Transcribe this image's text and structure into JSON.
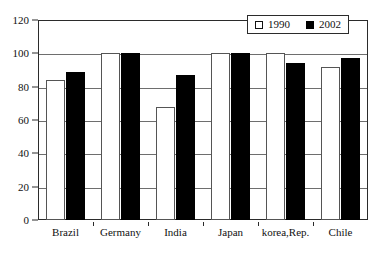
{
  "chart_data": {
    "type": "bar",
    "title": "",
    "xlabel": "",
    "ylabel": "",
    "ylim": [
      0,
      120
    ],
    "yticks": [
      0,
      20,
      40,
      60,
      80,
      100,
      120
    ],
    "ytick_labels": [
      "0",
      "20",
      "40",
      "60",
      "80",
      "100",
      "120"
    ],
    "grid": true,
    "legend_position": "top-right",
    "categories": [
      "Brazil",
      "Germany",
      "India",
      "Japan",
      "korea,Rep.",
      "Chile"
    ],
    "series": [
      {
        "name": "1990",
        "color": "#ffffff",
        "edge_color": "#555555",
        "values": [
          84,
          100,
          68,
          100,
          100,
          92
        ]
      },
      {
        "name": "2002",
        "color": "#000000",
        "edge_color": "#000000",
        "values": [
          89,
          100,
          87,
          100,
          94,
          97
        ]
      }
    ]
  },
  "legend": {
    "entries": [
      {
        "label": "1990",
        "swatch": "open-square-icon"
      },
      {
        "label": "2002",
        "swatch": "filled-square-icon"
      }
    ]
  },
  "colors": {
    "frame": "#2b2b2b",
    "gridline": "#6e6e6e",
    "background": "#ffffff",
    "text": "#111111"
  }
}
